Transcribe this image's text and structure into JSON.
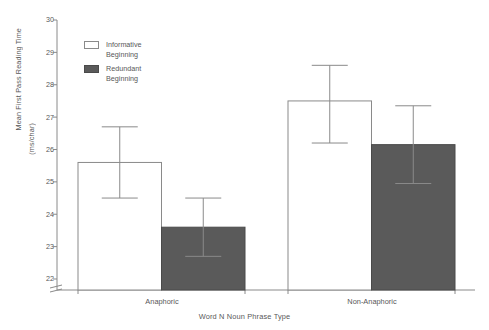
{
  "chart_data": {
    "type": "bar",
    "title": "",
    "subtitle": "",
    "xlabel": "Word N Noun Phrase Type",
    "ylabel": "Mean First Pass Reading Time",
    "ylabel_unit": "(ms/char)",
    "categories": [
      "Anaphoric",
      "Non-Anaphoric"
    ],
    "ylim": [
      21.66,
      30
    ],
    "yticks": [
      22,
      23,
      24,
      25,
      26,
      27,
      28,
      29,
      30
    ],
    "ytick_labels": [
      "22",
      "23",
      "24",
      "25",
      "26",
      "27",
      "28",
      "29",
      "30"
    ],
    "axis_break": true,
    "grid": false,
    "legend_position": "upper-left-inside",
    "series": [
      {
        "name": "Informative Beginning",
        "legend_label": "Informative\nBeginning",
        "fill": "#ffffff",
        "stroke": "#8a8a8a",
        "values": [
          25.6,
          27.5
        ],
        "error_upper": [
          26.7,
          28.6
        ],
        "error_lower": [
          24.5,
          26.2
        ]
      },
      {
        "name": "Redundant Beginning",
        "legend_label": "Redundant\nBeginning",
        "fill": "#5a5a5a",
        "stroke": "#4a4a4a",
        "values": [
          23.6,
          26.15
        ],
        "error_upper": [
          24.5,
          27.35
        ],
        "error_lower": [
          22.7,
          24.95
        ]
      }
    ]
  },
  "axes": {
    "y_title_main": "Mean First Pass Reading Time",
    "y_title_unit": "(ms/char)",
    "x_title": "Word N Noun Phrase Type",
    "ytick_0": "22",
    "ytick_1": "23",
    "ytick_2": "24",
    "ytick_3": "25",
    "ytick_4": "26",
    "ytick_5": "27",
    "ytick_6": "28",
    "ytick_7": "29",
    "ytick_8": "30",
    "xtick_0": "Anaphoric",
    "xtick_1": "Non-Anaphoric"
  },
  "legend": {
    "entries": [
      {
        "label": "Informative\nBeginning",
        "swatch": "open"
      },
      {
        "label": "Redundant\nBeginning",
        "swatch": "filled"
      }
    ]
  },
  "colors": {
    "bar_filled": "#5a5a5a",
    "bar_open": "#ffffff",
    "axis": "#8a8a8a",
    "text": "#585858"
  }
}
